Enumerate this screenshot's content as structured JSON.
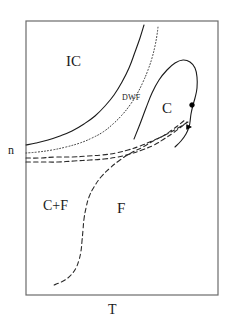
{
  "figure": {
    "background_color": "#ffffff",
    "frame": {
      "color": "#6b6b6b",
      "x": 26,
      "y": 21,
      "width": 192,
      "height": 274
    },
    "axis_labels": {
      "x_label": "T",
      "y_label": "n"
    },
    "region_labels": {
      "incommensurate": "IC",
      "commensurate": "C",
      "domain_wall_fluid": "DWF",
      "coexistence": "C+F",
      "fluid": "F"
    }
  },
  "chart_data": {
    "type": "line",
    "title": "",
    "xlabel": "T",
    "ylabel": "n",
    "xlim": [
      26,
      218
    ],
    "ylim": [
      295,
      21
    ],
    "grid": false,
    "legend_position": "none",
    "annotations": [
      {
        "name": "IC",
        "text": "IC",
        "x": 72,
        "y": 62,
        "font_size": 15
      },
      {
        "name": "C",
        "text": "C",
        "x": 166,
        "y": 110,
        "font_size": 15
      },
      {
        "name": "DWF",
        "text": "DWF",
        "x": 132,
        "y": 99,
        "font_size": 8
      },
      {
        "name": "n",
        "text": "n",
        "x": 12,
        "y": 152,
        "font_size": 12
      },
      {
        "name": "C+F",
        "text": "C+F",
        "x": 57,
        "y": 207,
        "font_size": 14
      },
      {
        "name": "F",
        "text": "F",
        "x": 120,
        "y": 210,
        "font_size": 15
      },
      {
        "name": "T",
        "text": "T",
        "x": 112,
        "y": 312,
        "font_size": 14
      }
    ],
    "series": [
      {
        "name": "ic-c-boundary-solid",
        "style": "solid",
        "color": "#1a1a1a",
        "width": 1.1,
        "points": [
          [
            26,
            145
          ],
          [
            36,
            143
          ],
          [
            48,
            140
          ],
          [
            60,
            136
          ],
          [
            72,
            131
          ],
          [
            84,
            124
          ],
          [
            95,
            116
          ],
          [
            105,
            106
          ],
          [
            114,
            95
          ],
          [
            122,
            82
          ],
          [
            129,
            68
          ],
          [
            135,
            52
          ],
          [
            140,
            38
          ],
          [
            144,
            25
          ]
        ]
      },
      {
        "name": "dwf-boundary-dotted",
        "style": "dotted",
        "color": "#3a3a3a",
        "width": 1.0,
        "points": [
          [
            26,
            153
          ],
          [
            38,
            152
          ],
          [
            52,
            150
          ],
          [
            66,
            147
          ],
          [
            80,
            143
          ],
          [
            92,
            138
          ],
          [
            103,
            132
          ],
          [
            113,
            124
          ],
          [
            122,
            115
          ],
          [
            130,
            105
          ],
          [
            137,
            94
          ],
          [
            143,
            82
          ],
          [
            148,
            70
          ],
          [
            152,
            58
          ],
          [
            155,
            46
          ],
          [
            157,
            35
          ],
          [
            158,
            27
          ]
        ]
      },
      {
        "name": "c-loop-solid",
        "style": "solid",
        "color": "#1a1a1a",
        "width": 1.1,
        "points": [
          [
            134,
            139
          ],
          [
            140,
            124
          ],
          [
            146,
            108
          ],
          [
            152,
            93
          ],
          [
            159,
            80
          ],
          [
            167,
            70
          ],
          [
            175,
            63
          ],
          [
            183,
            60
          ],
          [
            190,
            62
          ],
          [
            195,
            68
          ],
          [
            197,
            77
          ],
          [
            197,
            88
          ],
          [
            195,
            98
          ],
          [
            193,
            105
          ],
          [
            191,
            114
          ],
          [
            190,
            122
          ],
          [
            189,
            127
          ],
          [
            186,
            134
          ],
          [
            181,
            141
          ],
          [
            175,
            147
          ]
        ]
      },
      {
        "name": "c-f-boundary-dashed-upper",
        "style": "dashed",
        "color": "#2a2a2a",
        "width": 1.1,
        "points": [
          [
            26,
            158
          ],
          [
            40,
            158
          ],
          [
            56,
            157
          ],
          [
            72,
            157
          ],
          [
            88,
            156
          ],
          [
            102,
            155
          ],
          [
            116,
            153
          ],
          [
            128,
            150
          ],
          [
            140,
            146
          ],
          [
            152,
            141
          ],
          [
            163,
            136
          ],
          [
            172,
            130
          ],
          [
            180,
            124
          ],
          [
            186,
            119
          ]
        ]
      },
      {
        "name": "c-f-boundary-dashed-lower",
        "style": "dashed",
        "color": "#2a2a2a",
        "width": 1.1,
        "points": [
          [
            26,
            162
          ],
          [
            42,
            162
          ],
          [
            58,
            162
          ],
          [
            74,
            161
          ],
          [
            90,
            160
          ],
          [
            104,
            159
          ],
          [
            118,
            157
          ],
          [
            130,
            154
          ],
          [
            142,
            150
          ],
          [
            154,
            145
          ],
          [
            164,
            139
          ],
          [
            173,
            133
          ],
          [
            181,
            127
          ],
          [
            187,
            122
          ]
        ]
      },
      {
        "name": "coexistence-dashed-s-curve",
        "style": "dashed",
        "color": "#2a2a2a",
        "width": 1.1,
        "points": [
          [
            188,
            122
          ],
          [
            178,
            128
          ],
          [
            167,
            134
          ],
          [
            155,
            140
          ],
          [
            143,
            147
          ],
          [
            131,
            153
          ],
          [
            120,
            160
          ],
          [
            110,
            168
          ],
          [
            101,
            177
          ],
          [
            94,
            187
          ],
          [
            89,
            197
          ],
          [
            86,
            208
          ],
          [
            84,
            219
          ],
          [
            83,
            230
          ],
          [
            82,
            241
          ],
          [
            81,
            251
          ],
          [
            79,
            260
          ],
          [
            76,
            268
          ],
          [
            71,
            275
          ],
          [
            65,
            280
          ],
          [
            59,
            283
          ],
          [
            54,
            285
          ]
        ]
      }
    ],
    "markers": [
      {
        "name": "critical-point-circle",
        "shape": "circle",
        "x": 192,
        "y": 105,
        "size": 4.6,
        "color": "#000000",
        "filled": true
      },
      {
        "name": "triple-point-triangle",
        "shape": "triangle-right",
        "x": 189,
        "y": 127,
        "size": 4.6,
        "color": "#000000",
        "filled": true
      }
    ]
  }
}
